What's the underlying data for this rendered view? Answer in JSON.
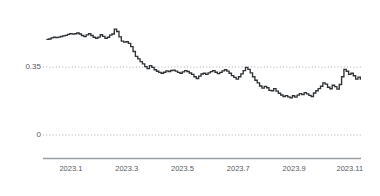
{
  "chart_data": {
    "type": "line",
    "title": "",
    "subtitle": "",
    "xlabel": "",
    "ylabel": "",
    "grid": true,
    "legend_position": "none",
    "line_color": "#2f3336",
    "gridline_color": "#a8acb1",
    "axis_color": "#9aa0a6",
    "tick_label_color": "#55595e",
    "xlim": [
      2023.0,
      2023.95
    ],
    "ylim": [
      -0.07,
      0.58
    ],
    "y_ticks": [
      0,
      0.35
    ],
    "y_tick_labels": [
      "0",
      "0.35"
    ],
    "x_ticks": [
      2023.1,
      2023.3,
      2023.5,
      2023.7,
      2023.9,
      2023.11
    ],
    "x_tick_labels": [
      "2023.1",
      "2023.3",
      "2023.5",
      "2023.7",
      "2023.9",
      "2023.11"
    ],
    "series": [
      {
        "name": "series-1",
        "x": [
          2023.01,
          2023.017,
          2023.024,
          2023.031,
          2023.038,
          2023.045,
          2023.052,
          2023.059,
          2023.066,
          2023.073,
          2023.08,
          2023.087,
          2023.094,
          2023.101,
          2023.108,
          2023.115,
          2023.122,
          2023.129,
          2023.136,
          2023.143,
          2023.15,
          2023.157,
          2023.164,
          2023.171,
          2023.178,
          2023.185,
          2023.192,
          2023.199,
          2023.206,
          2023.213,
          2023.22,
          2023.227,
          2023.234,
          2023.241,
          2023.248,
          2023.255,
          2023.262,
          2023.269,
          2023.276,
          2023.283,
          2023.29,
          2023.297,
          2023.304,
          2023.311,
          2023.318,
          2023.325,
          2023.332,
          2023.339,
          2023.346,
          2023.353,
          2023.36,
          2023.367,
          2023.374,
          2023.381,
          2023.388,
          2023.395,
          2023.402,
          2023.409,
          2023.416,
          2023.423,
          2023.43,
          2023.437,
          2023.444,
          2023.451,
          2023.458,
          2023.465,
          2023.472,
          2023.479,
          2023.486,
          2023.493,
          2023.5,
          2023.507,
          2023.514,
          2023.521,
          2023.528,
          2023.535,
          2023.542,
          2023.549,
          2023.556,
          2023.563,
          2023.57,
          2023.577,
          2023.584,
          2023.591,
          2023.598,
          2023.605,
          2023.612,
          2023.619,
          2023.626,
          2023.633,
          2023.64,
          2023.647,
          2023.654,
          2023.661,
          2023.668,
          2023.675,
          2023.682,
          2023.689,
          2023.696,
          2023.703,
          2023.71,
          2023.717,
          2023.724,
          2023.731,
          2023.738,
          2023.745,
          2023.752,
          2023.759,
          2023.766,
          2023.773,
          2023.78,
          2023.787,
          2023.794,
          2023.801,
          2023.808,
          2023.815,
          2023.822,
          2023.829,
          2023.836,
          2023.843,
          2023.85,
          2023.857,
          2023.864,
          2023.871,
          2023.878,
          2023.885,
          2023.892,
          2023.899,
          2023.906,
          2023.913,
          2023.92,
          2023.927,
          2023.934,
          2023.941,
          2023.948
        ],
        "values": [
          0.492,
          0.494,
          0.5,
          0.503,
          0.501,
          0.504,
          0.507,
          0.51,
          0.513,
          0.518,
          0.522,
          0.519,
          0.521,
          0.525,
          0.52,
          0.512,
          0.506,
          0.515,
          0.521,
          0.512,
          0.503,
          0.498,
          0.504,
          0.516,
          0.508,
          0.497,
          0.503,
          0.514,
          0.52,
          0.545,
          0.533,
          0.505,
          0.483,
          0.478,
          0.48,
          0.472,
          0.455,
          0.43,
          0.405,
          0.392,
          0.378,
          0.366,
          0.352,
          0.342,
          0.357,
          0.348,
          0.336,
          0.328,
          0.322,
          0.318,
          0.323,
          0.33,
          0.327,
          0.332,
          0.334,
          0.329,
          0.322,
          0.318,
          0.325,
          0.331,
          0.327,
          0.319,
          0.312,
          0.3,
          0.291,
          0.303,
          0.314,
          0.318,
          0.312,
          0.32,
          0.326,
          0.331,
          0.323,
          0.316,
          0.322,
          0.33,
          0.336,
          0.329,
          0.318,
          0.306,
          0.297,
          0.288,
          0.3,
          0.315,
          0.331,
          0.348,
          0.338,
          0.32,
          0.3,
          0.282,
          0.268,
          0.252,
          0.241,
          0.25,
          0.243,
          0.23,
          0.228,
          0.239,
          0.226,
          0.215,
          0.206,
          0.198,
          0.203,
          0.196,
          0.191,
          0.202,
          0.195,
          0.205,
          0.213,
          0.208,
          0.218,
          0.212,
          0.204,
          0.198,
          0.216,
          0.228,
          0.239,
          0.251,
          0.268,
          0.262,
          0.246,
          0.238,
          0.256,
          0.249,
          0.236,
          0.26,
          0.3,
          0.338,
          0.328,
          0.312,
          0.318,
          0.305,
          0.288,
          0.298,
          0.284
        ]
      }
    ]
  }
}
